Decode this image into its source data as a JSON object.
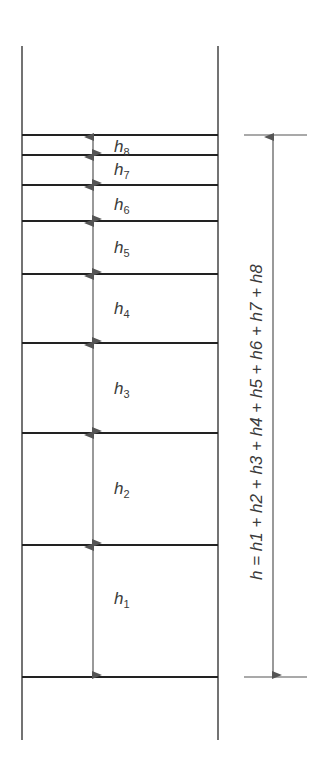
{
  "diagram": {
    "title": "",
    "layers": [
      {
        "name": "h",
        "sub": "8"
      },
      {
        "name": "h",
        "sub": "7"
      },
      {
        "name": "h",
        "sub": "6"
      },
      {
        "name": "h",
        "sub": "5"
      },
      {
        "name": "h",
        "sub": "4"
      },
      {
        "name": "h",
        "sub": "3"
      },
      {
        "name": "h",
        "sub": "2"
      },
      {
        "name": "h",
        "sub": "1"
      }
    ],
    "total_label": "h = h1 + h2 + h3 + h4 + h5 + h6 + h7 + h8",
    "colors": {
      "line": "#222222",
      "arrow": "#555555",
      "text": "#3a3a3a"
    }
  }
}
